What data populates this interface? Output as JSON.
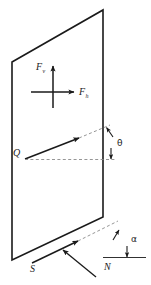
{
  "figure": {
    "type": "force-vector-diagram",
    "background_color": "#ffffff",
    "line_color": "#1a1a1a",
    "guide_color": "#9a9a9a",
    "width": 151,
    "height": 285
  },
  "labels": {
    "force_vertical": {
      "symbol": "F",
      "subscript": "v",
      "name": "vertical-force"
    },
    "force_horizontal": {
      "symbol": "F",
      "subscript": "h",
      "name": "horizontal-force"
    },
    "resultant": {
      "symbol": "Q",
      "name": "resultant-force"
    },
    "theta": {
      "symbol": "θ",
      "name": "elevation-angle"
    },
    "alpha": {
      "symbol": "α",
      "name": "strike-angle"
    },
    "strike": {
      "symbol": "S",
      "name": "strike-direction"
    },
    "north": {
      "symbol": "N",
      "name": "north-direction"
    }
  },
  "geometry": {
    "plane_corners": "12,62 103,10 103,217 12,260",
    "axis_origin": [
      53,
      92
    ],
    "q_origin": [
      25,
      159
    ],
    "q_tip": [
      79,
      138
    ]
  }
}
